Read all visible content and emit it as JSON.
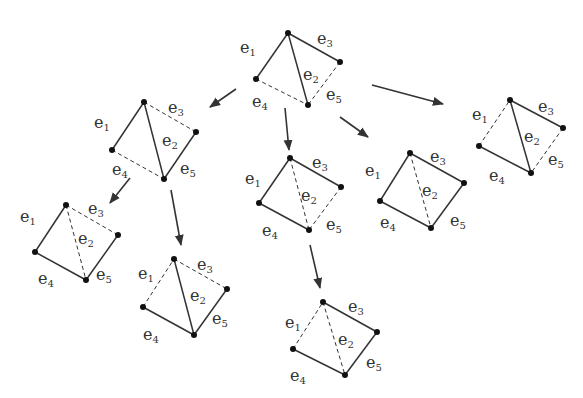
{
  "colors": {
    "edge": "#333333",
    "arrow": "#333333",
    "vertex": "#111111",
    "label": "#333333"
  },
  "graphs": [
    {
      "id": "root",
      "v": {
        "T": [
          288,
          33
        ],
        "R": [
          340,
          62
        ],
        "L": [
          256,
          79
        ],
        "B": [
          308,
          105
        ]
      },
      "edges": {
        "e1": "solid",
        "e2": "solid",
        "e3": "solid",
        "e4": "dashed",
        "e5": "dashed"
      },
      "labels": {
        "e1": [
          240,
          53
        ],
        "e2": [
          303,
          80
        ],
        "e3": [
          317,
          44
        ],
        "e4": [
          252,
          107
        ],
        "e5": [
          326,
          100
        ]
      }
    },
    {
      "id": "g2",
      "v": {
        "T": [
          144,
          102
        ],
        "R": [
          196,
          132
        ],
        "L": [
          112,
          150
        ],
        "B": [
          164,
          179
        ]
      },
      "edges": {
        "e1": "solid",
        "e2": "solid",
        "e3": "dashed",
        "e4": "dashed",
        "e5": "solid"
      },
      "labels": {
        "e1": [
          94,
          128
        ],
        "e2": [
          162,
          146
        ],
        "e3": [
          168,
          113
        ],
        "e4": [
          112,
          175
        ],
        "e5": [
          180,
          174
        ]
      }
    },
    {
      "id": "g3",
      "v": {
        "T": [
          290,
          158
        ],
        "R": [
          341,
          187
        ],
        "L": [
          259,
          203
        ],
        "B": [
          309,
          230
        ]
      },
      "edges": {
        "e1": "solid",
        "e2": "dashed",
        "e3": "solid",
        "e4": "solid",
        "e5": "dashed"
      },
      "labels": {
        "e1": [
          245,
          184
        ],
        "e2": [
          301,
          201
        ],
        "e3": [
          312,
          168
        ],
        "e4": [
          262,
          236
        ],
        "e5": [
          326,
          230
        ]
      }
    },
    {
      "id": "g4",
      "v": {
        "T": [
          410,
          153
        ],
        "R": [
          464,
          183
        ],
        "L": [
          380,
          201
        ],
        "B": [
          431,
          228
        ]
      },
      "edges": {
        "e1": "solid",
        "e2": "dashed",
        "e3": "solid",
        "e4": "solid",
        "e5": "solid"
      },
      "labels": {
        "e1": [
          365,
          176
        ],
        "e2": [
          422,
          196
        ],
        "e3": [
          430,
          162
        ],
        "e4": [
          380,
          228
        ],
        "e5": [
          450,
          226
        ]
      }
    },
    {
      "id": "g5",
      "v": {
        "T": [
          510,
          100
        ],
        "R": [
          563,
          128
        ],
        "L": [
          479,
          146
        ],
        "B": [
          531,
          173
        ]
      },
      "edges": {
        "e1": "dashed",
        "e2": "solid",
        "e3": "solid",
        "e4": "solid",
        "e5": "dashed"
      },
      "labels": {
        "e1": [
          472,
          120
        ],
        "e2": [
          524,
          142
        ],
        "e3": [
          538,
          112
        ],
        "e4": [
          489,
          181
        ],
        "e5": [
          548,
          165
        ]
      }
    },
    {
      "id": "g6",
      "v": {
        "T": [
          66,
          205
        ],
        "R": [
          118,
          235
        ],
        "L": [
          35,
          252
        ],
        "B": [
          86,
          280
        ]
      },
      "edges": {
        "e1": "solid",
        "e2": "dashed",
        "e3": "dashed",
        "e4": "solid",
        "e5": "solid"
      },
      "labels": {
        "e1": [
          20,
          222
        ],
        "e2": [
          78,
          244
        ],
        "e3": [
          88,
          214
        ],
        "e4": [
          38,
          284
        ],
        "e5": [
          96,
          280
        ]
      }
    },
    {
      "id": "g7",
      "v": {
        "T": [
          174,
          259
        ],
        "R": [
          227,
          289
        ],
        "L": [
          143,
          307
        ],
        "B": [
          194,
          335
        ]
      },
      "edges": {
        "e1": "dashed",
        "e2": "solid",
        "e3": "dashed",
        "e4": "solid",
        "e5": "solid"
      },
      "labels": {
        "e1": [
          138,
          279
        ],
        "e2": [
          190,
          301
        ],
        "e3": [
          197,
          270
        ],
        "e4": [
          143,
          340
        ],
        "e5": [
          212,
          324
        ]
      }
    },
    {
      "id": "g8",
      "v": {
        "T": [
          323,
          302
        ],
        "R": [
          377,
          332
        ],
        "L": [
          293,
          349
        ],
        "B": [
          345,
          375
        ]
      },
      "edges": {
        "e1": "dashed",
        "e2": "dashed",
        "e3": "solid",
        "e4": "solid",
        "e5": "solid"
      },
      "labels": {
        "e1": [
          285,
          328
        ],
        "e2": [
          338,
          345
        ],
        "e3": [
          348,
          312
        ],
        "e4": [
          290,
          381
        ],
        "e5": [
          366,
          368
        ]
      }
    }
  ],
  "edge_map": {
    "e1": [
      "L",
      "T"
    ],
    "e2": [
      "T",
      "B"
    ],
    "e3": [
      "T",
      "R"
    ],
    "e4": [
      "L",
      "B"
    ],
    "e5": [
      "R",
      "B"
    ]
  },
  "arrows": [
    {
      "from": [
        236,
        89
      ],
      "to": [
        210,
        107
      ]
    },
    {
      "from": [
        285,
        108
      ],
      "to": [
        289,
        150
      ]
    },
    {
      "from": [
        340,
        117
      ],
      "to": [
        368,
        137
      ]
    },
    {
      "from": [
        372,
        85
      ],
      "to": [
        443,
        104
      ]
    },
    {
      "from": [
        130,
        178
      ],
      "to": [
        110,
        203
      ]
    },
    {
      "from": [
        171,
        190
      ],
      "to": [
        181,
        245
      ]
    },
    {
      "from": [
        310,
        245
      ],
      "to": [
        320,
        288
      ]
    }
  ]
}
